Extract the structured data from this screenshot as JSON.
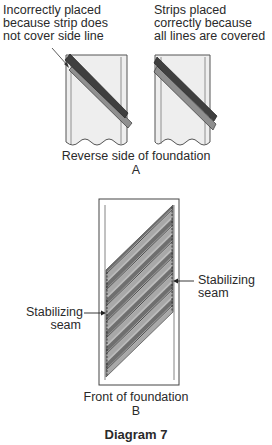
{
  "figure": {
    "title": "Diagram 7",
    "panel_a": {
      "left_caption": [
        "Incorrectly placed",
        "because strip does",
        "not cover side line"
      ],
      "right_caption": [
        "Strips placed",
        "correctly because",
        "all lines are covered"
      ],
      "caption": "Reverse side of foundation",
      "label": "A"
    },
    "panel_b": {
      "left_label": [
        "Stabilizing",
        "seam"
      ],
      "right_label": [
        "Stabilizing",
        "seam"
      ],
      "caption": "Front of foundation",
      "label": "B"
    },
    "colors": {
      "foundation_fill": "#eeeeee",
      "outline": "#444444",
      "dark_strip": "#4a4a4a",
      "mid_strip": "#8a8a8a",
      "light_strip": "#bdbdbd"
    }
  }
}
